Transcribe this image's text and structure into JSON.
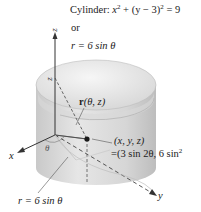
{
  "figure": {
    "equation_cartesian": {
      "prefix": "Cylinder: ",
      "x_var": "x",
      "x_exp": "2",
      "middle": " + (y − 3)",
      "y_exp": "2",
      "suffix": " = 9"
    },
    "or_label": "or",
    "equation_polar": "r = 6 sin θ",
    "position_vector_bold": "r",
    "position_vector_args": "(θ, z)",
    "point_label": "(x, y, z)",
    "point_value": "=(3 sin 2θ, 6 sin",
    "point_value_exp": "2",
    "base_curve_label": "r = 6 sin θ",
    "axes": {
      "x": "x",
      "y": "y",
      "z": "z"
    },
    "height_label": "z",
    "angle_label": "θ"
  },
  "colors": {
    "cylinder_fill": "#dcdcdc",
    "cylinder_top": "#ebebeb",
    "axis": "#333333",
    "point": "#1a1a1a"
  }
}
